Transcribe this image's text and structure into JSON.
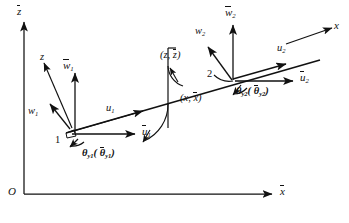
{
  "figure": {
    "type": "beam-element-dof-diagram"
  },
  "global_axes": {
    "origin_label": "O",
    "vertical_axis_label": "z",
    "vertical_axis_overbar": true,
    "horizontal_axis_label": "x",
    "horizontal_axis_overbar": true
  },
  "local_axes": {
    "x_label": "x",
    "z_label": "z",
    "angle_z_label_open": "(",
    "angle_z_label": "z, z",
    "angle_z_label_close": ")",
    "angle_x_label": "x, x",
    "pair_z": {
      "first": "z",
      "second": "z"
    },
    "pair_x": {
      "first": "x",
      "second": "x"
    }
  },
  "nodes": [
    {
      "id": "node-1",
      "number": "1",
      "local_axial": "u",
      "local_axial_sub": "1",
      "local_transverse": "w",
      "local_transverse_sub": "1",
      "global_axial": "u",
      "global_axial_sub": "1",
      "global_transverse": "w",
      "global_transverse_sub": "1",
      "rotation_local": "θ",
      "rotation_local_sub": "y1",
      "rotation_global": "θ",
      "rotation_global_sub": "y1",
      "rotation_open": "(",
      "rotation_close": ")"
    },
    {
      "id": "node-2",
      "number": "2",
      "local_axial": "u",
      "local_axial_sub": "2",
      "local_transverse": "w",
      "local_transverse_sub": "2",
      "global_axial": "u",
      "global_axial_sub": "2",
      "global_transverse": "w",
      "global_transverse_sub": "2",
      "rotation_local": "θ",
      "rotation_local_sub": "y2",
      "rotation_global": "θ",
      "rotation_global_sub": "y2",
      "rotation_open": "(",
      "rotation_close": ")"
    }
  ],
  "colors": {
    "ink": "#111111",
    "background": "#ffffff"
  }
}
